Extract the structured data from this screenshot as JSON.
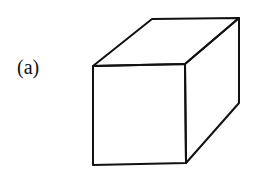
{
  "figure": {
    "label": "(a)",
    "stroke_color": "#111111",
    "background": "#ffffff",
    "vertices": {
      "front_top_left": [
        93,
        66
      ],
      "front_top_right": [
        185,
        64
      ],
      "front_bottom_left": [
        93,
        165
      ],
      "front_bottom_right": [
        186,
        163
      ],
      "back_top_left": [
        152,
        19
      ],
      "back_top_right": [
        239,
        18
      ],
      "back_bottom_right": [
        239,
        103
      ]
    }
  }
}
